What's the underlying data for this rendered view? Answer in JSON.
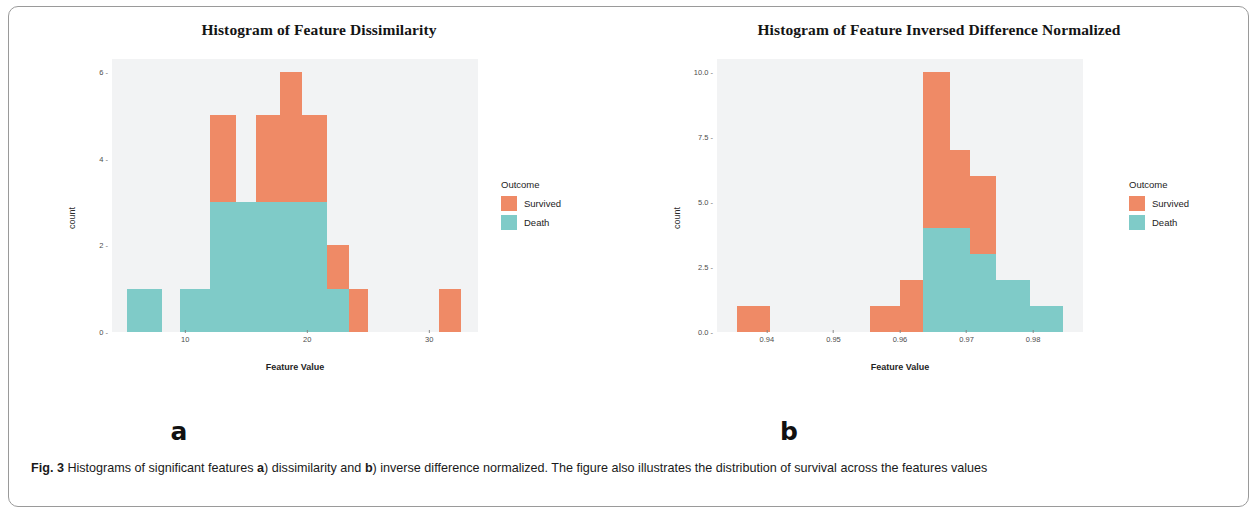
{
  "colors": {
    "survived": "#ef8a66",
    "death": "#7fcbc8",
    "panel_bg": "#f2f3f4",
    "frame_border": "#9a9a9a"
  },
  "caption": {
    "figure_label": "Fig. 3",
    "text_1": " Histograms of significant features ",
    "bold_a": "a",
    "text_2": ") dissimilarity and ",
    "bold_b": "b",
    "text_3": ") inverse difference normalized. The figure also illustrates the distribution of survival across the features values"
  },
  "legend": {
    "title": "Outcome",
    "items": [
      {
        "label": "Survived",
        "color": "#ef8a66"
      },
      {
        "label": "Death",
        "color": "#7fcbc8"
      }
    ]
  },
  "panels": [
    {
      "letter": "a"
    },
    {
      "letter": "b"
    }
  ],
  "chart_data": [
    {
      "type": "bar",
      "title": "Histogram of Feature Dissimilarity",
      "xlabel": "Feature Value",
      "ylabel": "count",
      "xlim": [
        4.0,
        34.0
      ],
      "ylim": [
        0,
        6.3
      ],
      "xticks": [
        "10",
        "20",
        "30"
      ],
      "xtick_values": [
        10,
        20,
        30
      ],
      "yticks": [
        "0",
        "2",
        "4",
        "6"
      ],
      "ytick_values": [
        0,
        2,
        4,
        6
      ],
      "grid": false,
      "legend_position": "right",
      "stacked": true,
      "series": [
        {
          "name": "Survived",
          "color": "#ef8a66",
          "values": [
            0,
            0,
            2,
            0,
            2,
            2,
            1,
            1,
            0,
            1
          ]
        },
        {
          "name": "Death",
          "color": "#7fcbc8",
          "values": [
            1,
            0,
            1,
            3,
            1,
            3,
            3,
            1,
            0,
            0
          ]
        }
      ],
      "bins": [
        {
          "x0": 5.2,
          "x1": 8.1,
          "survived": 0,
          "death": 1,
          "total": 1
        },
        {
          "x0": 8.1,
          "x1": 9.6,
          "survived": 0,
          "death": 0,
          "total": 0
        },
        {
          "x0": 9.6,
          "x1": 12.0,
          "survived": 0,
          "death": 1,
          "total": 1
        },
        {
          "x0": 12.0,
          "x1": 14.2,
          "survived": 2,
          "death": 3,
          "total": 5
        },
        {
          "x0": 14.2,
          "x1": 15.8,
          "survived": 0,
          "death": 3,
          "total": 3
        },
        {
          "x0": 15.8,
          "x1": 17.8,
          "survived": 2,
          "death": 3,
          "total": 5
        },
        {
          "x0": 17.8,
          "x1": 19.6,
          "survived": 3,
          "death": 3,
          "total": 6
        },
        {
          "x0": 19.6,
          "x1": 21.6,
          "survived": 2,
          "death": 3,
          "total": 5
        },
        {
          "x0": 21.6,
          "x1": 23.4,
          "survived": 1,
          "death": 1,
          "total": 2
        },
        {
          "x0": 23.4,
          "x1": 25.0,
          "survived": 1,
          "death": 0,
          "total": 1
        },
        {
          "x0": 30.8,
          "x1": 32.6,
          "survived": 1,
          "death": 0,
          "total": 1
        }
      ]
    },
    {
      "type": "bar",
      "title": "Histogram of Feature Inversed Difference Normalized",
      "xlabel": "Feature Value",
      "ylabel": "count",
      "xlim": [
        0.9325,
        0.9875
      ],
      "ylim": [
        0,
        10.5
      ],
      "xticks": [
        "0.94",
        "0.95",
        "0.96",
        "0.97",
        "0.98"
      ],
      "xtick_values": [
        0.94,
        0.95,
        0.96,
        0.97,
        0.98
      ],
      "yticks": [
        "0.0",
        "2.5",
        "5.0",
        "7.5",
        "10.0"
      ],
      "ytick_values": [
        0.0,
        2.5,
        5.0,
        7.5,
        10.0
      ],
      "grid": false,
      "legend_position": "right",
      "stacked": true,
      "series": [
        {
          "name": "Survived",
          "color": "#ef8a66",
          "values": [
            1,
            1,
            2,
            6,
            3,
            3,
            0,
            0
          ]
        },
        {
          "name": "Death",
          "color": "#7fcbc8",
          "values": [
            0,
            0,
            0,
            4,
            4,
            3,
            2,
            1
          ]
        }
      ],
      "bins": [
        {
          "x0": 0.9355,
          "x1": 0.9405,
          "survived": 1,
          "death": 0,
          "total": 1
        },
        {
          "x0": 0.9555,
          "x1": 0.96,
          "survived": 1,
          "death": 0,
          "total": 1
        },
        {
          "x0": 0.96,
          "x1": 0.9635,
          "survived": 2,
          "death": 0,
          "total": 2
        },
        {
          "x0": 0.9635,
          "x1": 0.9675,
          "survived": 6,
          "death": 4,
          "total": 10
        },
        {
          "x0": 0.9675,
          "x1": 0.9705,
          "survived": 3,
          "death": 4,
          "total": 7
        },
        {
          "x0": 0.9705,
          "x1": 0.9745,
          "survived": 3,
          "death": 3,
          "total": 6
        },
        {
          "x0": 0.9745,
          "x1": 0.9795,
          "survived": 0,
          "death": 2,
          "total": 2
        },
        {
          "x0": 0.9795,
          "x1": 0.9845,
          "survived": 0,
          "death": 1,
          "total": 1
        }
      ]
    }
  ]
}
